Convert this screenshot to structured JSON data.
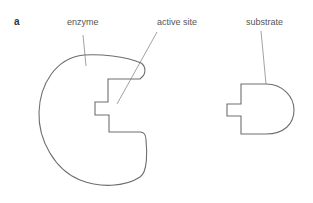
{
  "figure": {
    "panel_label": "a",
    "labels": {
      "enzyme": "enzyme",
      "active_site": "active site",
      "substrate": "substrate"
    },
    "colors": {
      "outline": "#6e6e6e",
      "leader": "#8a8a8a",
      "text": "#555555"
    }
  }
}
